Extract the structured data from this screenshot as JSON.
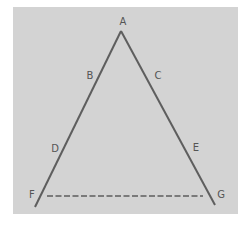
{
  "diagram": {
    "background_color": "#d3d3d3",
    "line_color": "#5e5e5e",
    "panel": {
      "x": 13,
      "y": 7,
      "width": 225,
      "height": 207
    },
    "apex": {
      "x": 121,
      "y": 31
    },
    "left_end": {
      "x": 35,
      "y": 207
    },
    "right_end": {
      "x": 215,
      "y": 205
    },
    "dashed_line": {
      "x1": 47,
      "y1": 196,
      "x2": 203,
      "y2": 196
    },
    "labels": [
      {
        "id": "A",
        "text": "A",
        "x": 123,
        "y": 25
      },
      {
        "id": "B",
        "text": "B",
        "x": 90,
        "y": 79
      },
      {
        "id": "C",
        "text": "C",
        "x": 158,
        "y": 79
      },
      {
        "id": "D",
        "text": "D",
        "x": 55,
        "y": 152
      },
      {
        "id": "E",
        "text": "E",
        "x": 196,
        "y": 151
      },
      {
        "id": "F",
        "text": "F",
        "x": 32,
        "y": 198
      },
      {
        "id": "G",
        "text": "G",
        "x": 221,
        "y": 198
      }
    ]
  }
}
